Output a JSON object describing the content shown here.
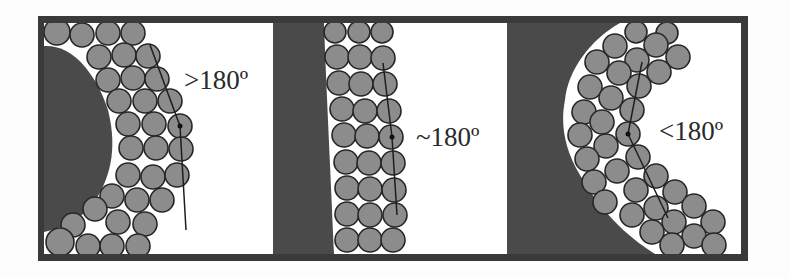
{
  "figure": {
    "panels": [
      {
        "id": "convex",
        "angle_label": ">180º",
        "shape": "convex-bulge"
      },
      {
        "id": "flat",
        "angle_label": "~180º",
        "shape": "flat-wall"
      },
      {
        "id": "concave",
        "angle_label": "<180º",
        "shape": "concave-pocket"
      }
    ],
    "colors": {
      "background": "#fdfdfd",
      "frame": "#3a3a3a",
      "solid_region": "#4a4a4a",
      "particle_fill": "#8c8c8c",
      "particle_outline": "#262626"
    }
  }
}
